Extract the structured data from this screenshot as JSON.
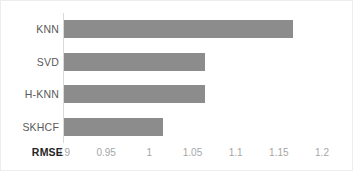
{
  "chart_data": {
    "type": "bar",
    "orientation": "horizontal",
    "title": "",
    "xlabel": "RMSE",
    "ylabel": "",
    "categories": [
      "KNN",
      "SVD",
      "H-KNN",
      "SKHCF"
    ],
    "values": [
      1.165,
      1.063,
      1.063,
      1.015
    ],
    "xlim": [
      0.9,
      1.2
    ],
    "xticks": [
      "0.9",
      "0.95",
      "1",
      "1.05",
      "1.1",
      "1.15",
      "1.2"
    ],
    "xtick_values": [
      0.9,
      0.95,
      1,
      1.05,
      1.1,
      1.15,
      1.2
    ],
    "grid": false,
    "legend": false,
    "bar_color": "#8c8c8c",
    "tick_label_color": "#a6a6a6",
    "category_label_color": "#595959",
    "axis_title_color": "#262626",
    "frame_color": "#ededed",
    "axis_line_color": "#d9d9d9"
  }
}
